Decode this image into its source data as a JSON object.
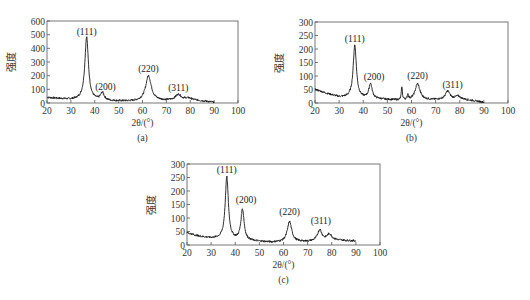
{
  "chart_data": [
    {
      "type": "line",
      "panel": "(a)",
      "caption": "(a)",
      "xlabel": "2θ/(°)",
      "ylabel": "强度",
      "xlim": [
        20,
        100
      ],
      "ylim": [
        0,
        600
      ],
      "xticks": [
        20,
        30,
        40,
        50,
        60,
        70,
        80,
        90,
        100
      ],
      "yticks": [
        0,
        100,
        200,
        300,
        400,
        500,
        600
      ],
      "grid": false,
      "data_range": [
        20,
        90
      ],
      "baseline": [
        [
          20,
          40
        ],
        [
          30,
          25
        ],
        [
          35,
          25
        ],
        [
          45,
          15
        ],
        [
          55,
          12
        ],
        [
          70,
          18
        ],
        [
          80,
          25
        ],
        [
          90,
          5
        ]
      ],
      "peaks": [
        {
          "label": "(111)",
          "x": 36.6,
          "height": 460,
          "width": 0.9
        },
        {
          "label": "(200)",
          "x": 43.2,
          "height": 55,
          "width": 0.9
        },
        {
          "label": "(220)",
          "x": 62.5,
          "height": 185,
          "width": 1.4
        },
        {
          "label": "(311)",
          "x": 75.0,
          "height": 40,
          "width": 1.4
        },
        {
          "label": "",
          "x": 79.0,
          "height": 10,
          "width": 1.5
        }
      ],
      "annotations": [
        {
          "text": "(111)",
          "x": 36.6,
          "y": 495
        },
        {
          "text": "(200)",
          "x": 44.5,
          "y": 95
        },
        {
          "text": "(220)",
          "x": 62.5,
          "y": 230
        },
        {
          "text": "(311)",
          "x": 75.0,
          "y": 85
        }
      ],
      "box": {
        "x0": 47,
        "y0": 21,
        "x1": 238,
        "y1": 103
      }
    },
    {
      "type": "line",
      "panel": "(b)",
      "caption": "(b)",
      "xlabel": "2θ/(°)",
      "ylabel": "强度",
      "xlim": [
        20,
        100
      ],
      "ylim": [
        0,
        300
      ],
      "xticks": [
        20,
        30,
        40,
        50,
        60,
        70,
        80,
        90,
        100
      ],
      "yticks": [
        0,
        50,
        100,
        150,
        200,
        250,
        300
      ],
      "grid": false,
      "data_range": [
        20,
        90
      ],
      "baseline": [
        [
          20,
          50
        ],
        [
          25,
          35
        ],
        [
          30,
          22
        ],
        [
          35,
          20
        ],
        [
          45,
          15
        ],
        [
          55,
          10
        ],
        [
          70,
          12
        ],
        [
          80,
          15
        ],
        [
          90,
          3
        ]
      ],
      "peaks": [
        {
          "label": "(111)",
          "x": 36.5,
          "height": 195,
          "width": 0.8
        },
        {
          "label": "(200)",
          "x": 43.0,
          "height": 55,
          "width": 0.8
        },
        {
          "label": "",
          "x": 56.0,
          "height": 50,
          "width": 0.25
        },
        {
          "label": "",
          "x": 58.5,
          "height": 18,
          "width": 0.3
        },
        {
          "label": "(220)",
          "x": 62.5,
          "height": 60,
          "width": 1.2
        },
        {
          "label": "(311)",
          "x": 75.0,
          "height": 30,
          "width": 1.1
        },
        {
          "label": "",
          "x": 79.2,
          "height": 10,
          "width": 1.2
        }
      ],
      "annotations": [
        {
          "text": "(111)",
          "x": 36.5,
          "y": 225
        },
        {
          "text": "(200)",
          "x": 44.5,
          "y": 85
        },
        {
          "text": "(220)",
          "x": 62.5,
          "y": 88
        },
        {
          "text": "(311)",
          "x": 77.0,
          "y": 55
        }
      ],
      "box": {
        "x0": 315,
        "y0": 22,
        "x1": 508,
        "y1": 103
      }
    },
    {
      "type": "line",
      "panel": "(c)",
      "caption": "(c)",
      "xlabel": "2θ/(°)",
      "ylabel": "强度",
      "xlim": [
        20,
        100
      ],
      "ylim": [
        0,
        300
      ],
      "xticks": [
        20,
        30,
        40,
        50,
        60,
        70,
        80,
        90,
        100
      ],
      "yticks": [
        0,
        50,
        100,
        150,
        200,
        250,
        300
      ],
      "grid": false,
      "data_range": [
        20,
        90
      ],
      "baseline": [
        [
          20,
          45
        ],
        [
          25,
          32
        ],
        [
          30,
          25
        ],
        [
          35,
          22
        ],
        [
          45,
          15
        ],
        [
          55,
          10
        ],
        [
          70,
          12
        ],
        [
          80,
          18
        ],
        [
          90,
          15
        ]
      ],
      "peaks": [
        {
          "label": "(111)",
          "x": 36.5,
          "height": 230,
          "width": 0.8
        },
        {
          "label": "(200)",
          "x": 43.0,
          "height": 115,
          "width": 0.8
        },
        {
          "label": "(220)",
          "x": 62.5,
          "height": 75,
          "width": 1.1
        },
        {
          "label": "(311)",
          "x": 75.0,
          "height": 40,
          "width": 1.1
        },
        {
          "label": "",
          "x": 79.0,
          "height": 22,
          "width": 1.2
        }
      ],
      "annotations": [
        {
          "text": "(111)",
          "x": 36.5,
          "y": 268
        },
        {
          "text": "(200)",
          "x": 44.5,
          "y": 155
        },
        {
          "text": "(220)",
          "x": 62.5,
          "y": 112
        },
        {
          "text": "(311)",
          "x": 75.5,
          "y": 78
        }
      ],
      "box": {
        "x0": 187,
        "y0": 164,
        "x1": 380,
        "y1": 245
      }
    }
  ],
  "colors": {
    "line": "#1a1a1a",
    "frame": "#555555",
    "text": "#333333"
  }
}
